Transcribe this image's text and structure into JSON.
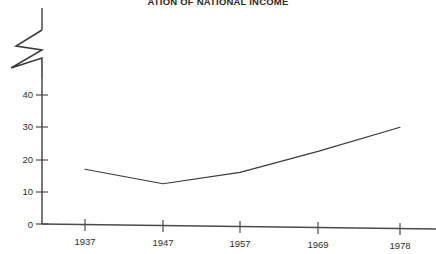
{
  "chart_data": {
    "type": "line",
    "title": "ATION OF NATIONAL INCOME",
    "xlabel": "",
    "ylabel": "",
    "x": [
      1937,
      1947,
      1957,
      1969,
      1978
    ],
    "categories": [
      "1937",
      "1947",
      "1957",
      "1969",
      "1978"
    ],
    "values": [
      17,
      12.5,
      16,
      22.5,
      30
    ],
    "series": [
      {
        "name": "",
        "values": [
          17,
          12.5,
          16,
          22.5,
          30
        ]
      }
    ],
    "ylim": [
      0,
      45
    ],
    "yticks": [
      0,
      10,
      20,
      30,
      40
    ],
    "ytick_labels": [
      "0",
      "10",
      "20",
      "30",
      "40"
    ],
    "xtick_labels": [
      "1937",
      "1947",
      "1957",
      "1969",
      "1978"
    ],
    "grid": false,
    "legend": "none",
    "axis_break": true,
    "axis_break_note": "zigzag break symbol on y-axis above 40",
    "line_color": "#3a3a3a",
    "axis_color": "#4a4a4a"
  },
  "axis": {
    "y_tick_0": "0",
    "y_tick_10": "10",
    "y_tick_20": "20",
    "y_tick_30": "30",
    "y_tick_40": "40",
    "x_tick_1": "1937",
    "x_tick_2": "1947",
    "x_tick_3": "1957",
    "x_tick_4": "1969",
    "x_tick_5": "1978"
  }
}
